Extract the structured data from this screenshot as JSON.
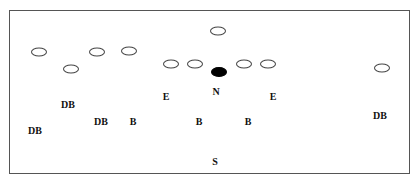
{
  "diagram": {
    "type": "football-formation",
    "frame": {
      "left": 9,
      "top": 10,
      "right": 410,
      "bottom": 174,
      "stroke": "#555555"
    },
    "offense_players": [
      {
        "id": "o1",
        "x": 39,
        "y": 52,
        "filled": false
      },
      {
        "id": "o2",
        "x": 71,
        "y": 69,
        "filled": false
      },
      {
        "id": "o3",
        "x": 97,
        "y": 52,
        "filled": false
      },
      {
        "id": "o4",
        "x": 129,
        "y": 51,
        "filled": false
      },
      {
        "id": "o5",
        "x": 218,
        "y": 31,
        "filled": false
      },
      {
        "id": "o6",
        "x": 171,
        "y": 64,
        "filled": false
      },
      {
        "id": "o7",
        "x": 195,
        "y": 64,
        "filled": false
      },
      {
        "id": "o8",
        "x": 244,
        "y": 64,
        "filled": false
      },
      {
        "id": "o9",
        "x": 268,
        "y": 64,
        "filled": false
      },
      {
        "id": "o10",
        "x": 382,
        "y": 68,
        "filled": false
      },
      {
        "id": "ball",
        "x": 219,
        "y": 72,
        "filled": true
      }
    ],
    "defense_labels": [
      {
        "text": "DB",
        "x": 68,
        "y": 104
      },
      {
        "text": "DB",
        "x": 35,
        "y": 130
      },
      {
        "text": "DB",
        "x": 101,
        "y": 121
      },
      {
        "text": "B",
        "x": 133,
        "y": 121
      },
      {
        "text": "E",
        "x": 166,
        "y": 96
      },
      {
        "text": "N",
        "x": 216,
        "y": 91
      },
      {
        "text": "E",
        "x": 273,
        "y": 96
      },
      {
        "text": "B",
        "x": 199,
        "y": 121
      },
      {
        "text": "B",
        "x": 248,
        "y": 121
      },
      {
        "text": "DB",
        "x": 380,
        "y": 115
      },
      {
        "text": "S",
        "x": 215,
        "y": 161
      }
    ],
    "caption_partial": ""
  }
}
